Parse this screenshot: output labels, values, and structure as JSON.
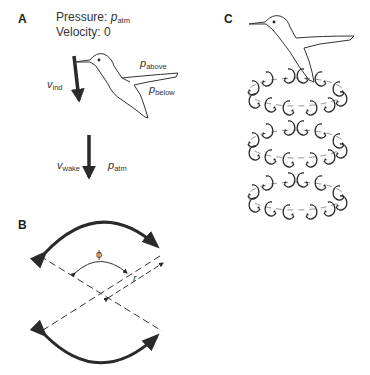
{
  "figure": {
    "panels": [
      {
        "id": "A",
        "label": "A",
        "title_line1_prefix": "Pressure: ",
        "title_line1_var": "p",
        "title_line1_sub": "atm",
        "title_line2": "Velocity: 0",
        "labels": {
          "v_ind": {
            "var": "v",
            "sub": "ind"
          },
          "p_above": {
            "var": "p",
            "sub": "above"
          },
          "p_below": {
            "var": "p",
            "sub": "below"
          },
          "v_wake": {
            "var": "v",
            "sub": "wake"
          },
          "p_atm": {
            "var": "p",
            "sub": "atm"
          }
        },
        "icons": [
          "hummingbird-icon",
          "induced-velocity-arrow",
          "wake-velocity-arrow"
        ]
      },
      {
        "id": "B",
        "label": "B",
        "labels": {
          "phi": "ϕ",
          "r": "r"
        },
        "icons": [
          "stroke-arc-top",
          "stroke-arc-bottom",
          "dashed-wing-lines",
          "angle-arc",
          "radius-arrow"
        ]
      },
      {
        "id": "C",
        "label": "C",
        "vortex_ring_layers": 3,
        "icons": [
          "hummingbird-icon",
          "vortex-rings"
        ]
      }
    ],
    "colors": {
      "ink": "#2a2a2a",
      "text": "#333333",
      "background": "#ffffff"
    }
  }
}
